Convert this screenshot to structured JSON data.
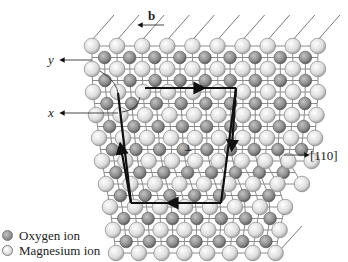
{
  "figure": {
    "labels": {
      "burgers_vector": "b",
      "y_axis": "y",
      "x_axis": "x",
      "direction": "[110]",
      "dislocation_symbol": "⊥"
    },
    "legend": [
      {
        "label": "Oxygen ion",
        "color": "#8a8a8a"
      },
      {
        "label": "Magnesium ion",
        "color": "#e6e6e6"
      }
    ],
    "colors": {
      "oxygen": "#8a8a8a",
      "magnesium": "#e6e6e6",
      "bond": "#8c8c8c",
      "circuit": "#111111"
    }
  }
}
